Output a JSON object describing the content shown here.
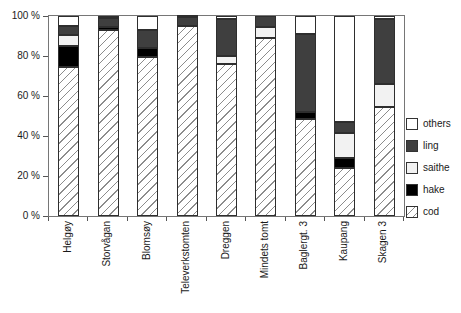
{
  "chart_data": {
    "type": "bar",
    "stacked": true,
    "units": "percent",
    "title": "",
    "xlabel": "",
    "ylabel": "",
    "grid": false,
    "ylim": [
      0,
      100
    ],
    "categories": [
      "Helgøy",
      "Storvågan",
      "Blomsøy",
      "Televerkstomten",
      "Dreggen",
      "Mindets tomt",
      "Baglergt. 3",
      "Kaupang",
      "Skagen 3"
    ],
    "series": [
      {
        "name": "cod",
        "pattern": "hatch",
        "color": "#ffffff",
        "values": [
          74.5,
          93,
          79.5,
          95,
          76,
          89,
          48.5,
          24,
          54.5
        ]
      },
      {
        "name": "hake",
        "pattern": "solid",
        "color": "#000000",
        "values": [
          10.5,
          1.5,
          4.5,
          0,
          0,
          0,
          3.5,
          5,
          0
        ]
      },
      {
        "name": "saithe",
        "pattern": "solid",
        "color": "#f2f2f2",
        "values": [
          5.5,
          0,
          0,
          0,
          4,
          5.5,
          0,
          12.5,
          11.5
        ]
      },
      {
        "name": "ling",
        "pattern": "solid",
        "color": "#3f3f3f",
        "values": [
          4.5,
          4.5,
          9,
          4.5,
          18.5,
          5.5,
          39,
          5.5,
          32.5
        ]
      },
      {
        "name": "others",
        "pattern": "solid",
        "color": "#ffffff",
        "values": [
          5,
          1,
          7,
          0.5,
          1.5,
          0,
          9,
          53,
          1.5
        ]
      }
    ],
    "y_ticks": [
      {
        "value": 100,
        "label": "100 %"
      },
      {
        "value": 80,
        "label": "80 %"
      },
      {
        "value": 60,
        "label": "60 %"
      },
      {
        "value": 40,
        "label": "40 %"
      },
      {
        "value": 20,
        "label": "20 %"
      },
      {
        "value": 0,
        "label": "0 %"
      }
    ],
    "legend": [
      "others",
      "ling",
      "saithe",
      "hake",
      "cod"
    ],
    "legend_position": "right"
  },
  "colors": {
    "hatch_line": "#8c8c8c",
    "segment_border": "#2e2e2e",
    "plot_border": "#767676",
    "text": "#1a1a1a"
  }
}
